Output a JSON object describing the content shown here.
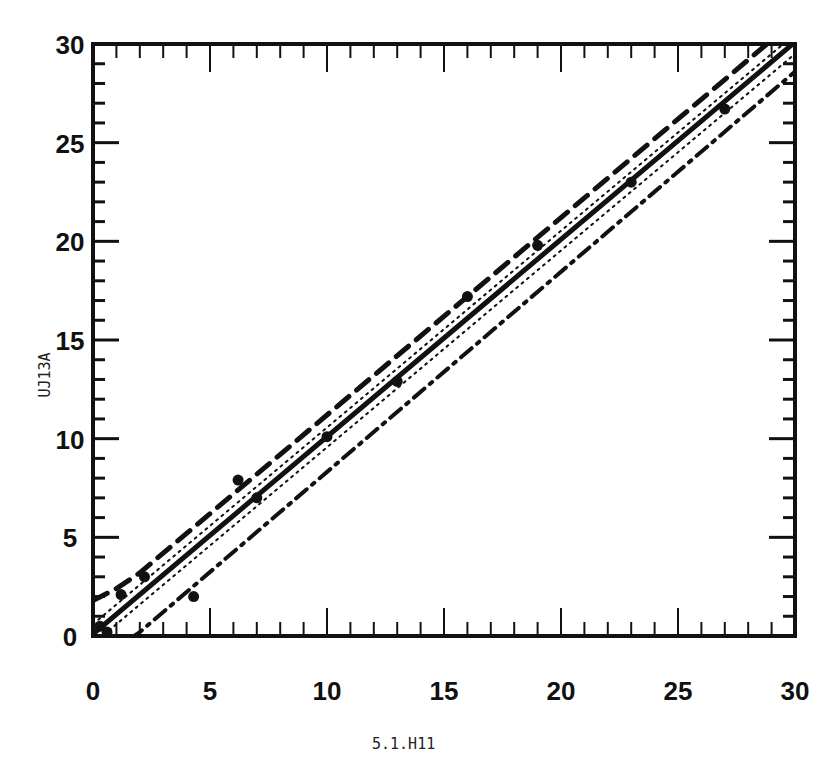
{
  "chart_data": {
    "type": "scatter",
    "title": "",
    "xlabel": "5.1.H11",
    "ylabel": "UJ13A",
    "xlim": [
      0,
      30
    ],
    "ylim": [
      0,
      30
    ],
    "x_ticks": [
      0,
      5,
      10,
      15,
      20,
      25,
      30
    ],
    "y_ticks": [
      0,
      5,
      10,
      15,
      20,
      25,
      30
    ],
    "minor_tick_step": 1,
    "grid": false,
    "legend": null,
    "points": [
      {
        "x": 0.3,
        "y": 0.5
      },
      {
        "x": 0.6,
        "y": 0.2
      },
      {
        "x": 1.2,
        "y": 2.1
      },
      {
        "x": 2.2,
        "y": 3.0
      },
      {
        "x": 4.3,
        "y": 2.0
      },
      {
        "x": 6.2,
        "y": 7.9
      },
      {
        "x": 7.0,
        "y": 7.0
      },
      {
        "x": 10.0,
        "y": 10.1
      },
      {
        "x": 13.0,
        "y": 12.9
      },
      {
        "x": 16.0,
        "y": 17.2
      },
      {
        "x": 19.0,
        "y": 19.8
      },
      {
        "x": 23.0,
        "y": 23.0
      },
      {
        "x": 27.0,
        "y": 26.7
      }
    ],
    "series": [
      {
        "name": "regression fit",
        "style": "solid",
        "x": [
          0,
          30
        ],
        "y": [
          0.1,
          30.1
        ]
      },
      {
        "name": "inner confidence band upper",
        "style": "dotted",
        "x": [
          0,
          30
        ],
        "y": [
          0.6,
          30.5
        ]
      },
      {
        "name": "inner confidence band lower",
        "style": "dotted",
        "x": [
          0,
          30
        ],
        "y": [
          -0.4,
          29.5
        ]
      },
      {
        "name": "outer prediction band upper",
        "style": "dashed",
        "x": [
          0,
          1,
          2,
          30
        ],
        "y": [
          1.8,
          2.4,
          3.2,
          31.2
        ]
      },
      {
        "name": "outer prediction band lower",
        "style": "dash-dot",
        "x": [
          0.5,
          1,
          2,
          30
        ],
        "y": [
          -1.0,
          -0.6,
          0.2,
          28.6
        ]
      }
    ]
  }
}
